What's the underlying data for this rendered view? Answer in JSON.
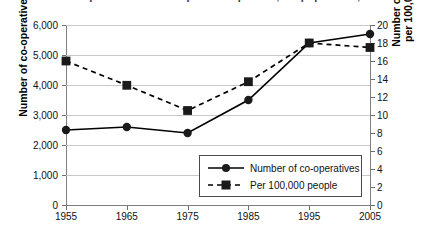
{
  "title": {
    "text": "Number of co-operatives and co-operatives per 100,000 population, 1955-2005",
    "cropped": true
  },
  "chart_data": {
    "type": "line",
    "title": "Number of co-operatives and co-operatives per 100,000 population, 1955-2005",
    "xlabel": "",
    "categories": [
      "1955",
      "1965",
      "1975",
      "1985",
      "1995",
      "2005"
    ],
    "grid": "horizontal",
    "legend_position": "bottom-center-right",
    "axes": {
      "left": {
        "label": "Number of co-operatives",
        "min": 0,
        "max": 6000,
        "step": 1000,
        "ticks": [
          "0",
          "1,000",
          "2,000",
          "3,000",
          "4,000",
          "5,000",
          "6,000"
        ]
      },
      "right": {
        "label_line1": "Number of co-operatives",
        "label_line2": "per 100,000 population",
        "min": 0,
        "max": 20,
        "step": 2,
        "ticks": [
          "0",
          "2",
          "4",
          "6",
          "8",
          "10",
          "12",
          "14",
          "16",
          "18",
          "20"
        ]
      }
    },
    "series": [
      {
        "name": "Number of co-operatives",
        "axis": "left",
        "marker": "circle",
        "line_style": "solid",
        "color": "#000000",
        "values": [
          2500,
          2600,
          2400,
          3500,
          5400,
          5700
        ]
      },
      {
        "name": "Per 100,000 people",
        "axis": "right",
        "marker": "square",
        "line_style": "dashed",
        "color": "#000000",
        "values": [
          16.0,
          13.3,
          10.5,
          13.7,
          18.0,
          17.5
        ]
      }
    ]
  }
}
